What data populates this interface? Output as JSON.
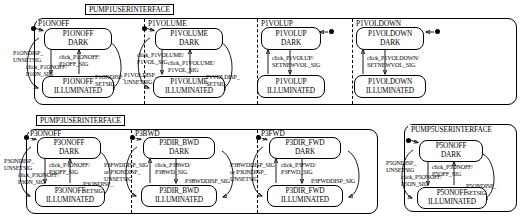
{
  "diagram": {
    "type": "statechart",
    "regions": [
      {
        "id": "pump1",
        "title": "PUMP1USERINTERFACE",
        "subregions": [
          {
            "name": "P1ONOFF",
            "states": [
              {
                "id": "p1onoff-dark",
                "line1": "P1ONOFF",
                "line2": "DARK"
              },
              {
                "id": "p1onoff-ill",
                "line1": "P1ONOFF",
                "line2": "ILLUMINATED"
              }
            ],
            "transitions": [
              {
                "id": "t1",
                "line1": "P1ONDISP_",
                "line2": "UNSETSIG"
              },
              {
                "id": "t2",
                "line1": "click_P1ONOFF/",
                "line2": "P1ON_SIG"
              },
              {
                "id": "t3",
                "line1": "click_P1ONOFF/",
                "line2": "P1OFF_SIG"
              },
              {
                "id": "t4",
                "line1": "P1ONDISP_",
                "line2": "SETSIG"
              }
            ]
          },
          {
            "name": "P1VOLUME",
            "states": [
              {
                "id": "p1volume-dark",
                "line1": "P1VOLUME",
                "line2": "DARK"
              },
              {
                "id": "p1volume-ill",
                "line1": "P1VOLUME",
                "line2": "ILLUMINATED"
              }
            ],
            "transitions": [
              {
                "id": "t1",
                "line1": "P1VOLDISP_",
                "line2": "UNSETSIG"
              },
              {
                "id": "t2",
                "line1": "click_P1VOLUME/",
                "line2": "P1VOL_SIG"
              },
              {
                "id": "t3",
                "line1": "click_P1VOLUME/",
                "line2": "P1VOL_SIG"
              },
              {
                "id": "t4",
                "line1": "P1VOLDISP_",
                "line2": "SETSIG"
              }
            ]
          },
          {
            "name": "P1VOLUP",
            "states": [
              {
                "id": "p1volup-dark",
                "line1": "P1VOLUP",
                "line2": "DARK"
              },
              {
                "id": "p1volup-ill",
                "line1": "P1VOLUP",
                "line2": "ILLUMINATED"
              }
            ],
            "transitions": [
              {
                "id": "t1",
                "line1": "click_P1VOLUP/",
                "line2": "SETNEWVOL_SIG"
              }
            ]
          },
          {
            "name": "P1VOLDOWN",
            "states": [
              {
                "id": "p1voldown-dark",
                "line1": "P1VOLDOWN",
                "line2": "DARK"
              },
              {
                "id": "p1voldown-ill",
                "line1": "P1VOLDOWN",
                "line2": "ILLUMINATED"
              }
            ],
            "transitions": [
              {
                "id": "t1",
                "line1": "click_P1VOLDOWN/",
                "line2": "SETNEWVOL_SIG"
              }
            ]
          }
        ]
      },
      {
        "id": "pump3",
        "title": "PUMP3USERINTERFACE",
        "subregions": [
          {
            "name": "P3ONOFF",
            "states": [
              {
                "id": "p3onoff-dark",
                "line1": "P3ONOFF",
                "line2": "DARK"
              },
              {
                "id": "p3onoff-ill",
                "line1": "P3ONOFF",
                "line2": "ILLUMINATED"
              }
            ],
            "transitions": [
              {
                "id": "t1",
                "line1": "P3ONDISP_",
                "line2": "UNSETSIG"
              },
              {
                "id": "t2",
                "line1": "click_P3ONOFF/",
                "line2": "P3ON_SIG"
              },
              {
                "id": "t3",
                "line1": "click_P3ONOFF/",
                "line2": "P3OFF_SIG"
              },
              {
                "id": "t4",
                "line1": "P3ONDISP_",
                "line2": "SETSIG"
              }
            ]
          },
          {
            "name": "P3BWD",
            "states": [
              {
                "id": "p3bwd-dark",
                "line1": "P3DIR_BWD",
                "line2": "DARK"
              },
              {
                "id": "p3bwd-ill",
                "line1": "P3DIR_BWD",
                "line2": "ILLUMINATED"
              }
            ],
            "transitions": [
              {
                "id": "t1",
                "line1": "P3FWDDISP_SIG",
                "line2": "or P3ONDISP_",
                "line3": "UNSETSIG"
              },
              {
                "id": "t2",
                "line1": "click_P3BWD/",
                "line2": "P3BWD_SIG"
              },
              {
                "id": "t3",
                "line1": "P3BWDDISP_SIG"
              }
            ]
          },
          {
            "name": "P3FWD",
            "states": [
              {
                "id": "p3fwd-dark",
                "line1": "P3DIR_FWD",
                "line2": "DARK"
              },
              {
                "id": "p3fwd-ill",
                "line1": "P3DIR_FWD",
                "line2": "ILLUMINATED"
              }
            ],
            "transitions": [
              {
                "id": "t1",
                "line1": "P3BWDDISP_SIG",
                "line2": "or P3ONDISP_",
                "line3": "UNSETSIG"
              },
              {
                "id": "t2",
                "line1": "click_P3FWD/",
                "line2": "P3FWD_SIG"
              },
              {
                "id": "t3",
                "line1": "P3FWDDISP_SIG"
              }
            ]
          }
        ]
      },
      {
        "id": "pump5",
        "title": "PUMP5USERINTERFACE",
        "subregions": [
          {
            "name": "",
            "states": [
              {
                "id": "p5onoff-dark",
                "line1": "P5ONOFF",
                "line2": "DARK"
              },
              {
                "id": "p5onoff-ill",
                "line1": "P5ONOFF",
                "line2": "ILLUMINATED"
              }
            ],
            "transitions": [
              {
                "id": "t1",
                "line1": "P5ONDISP_",
                "line2": "UNSETSIG"
              },
              {
                "id": "t2",
                "line1": "click_P5ONOFF/",
                "line2": "P5ON_SIG"
              },
              {
                "id": "t3",
                "line1": "click_P5ONOFF/",
                "line2": "P5OFF_SIG"
              },
              {
                "id": "t4",
                "line1": "P5ONDISP_",
                "line2": "SETSIG"
              }
            ]
          }
        ]
      }
    ]
  }
}
